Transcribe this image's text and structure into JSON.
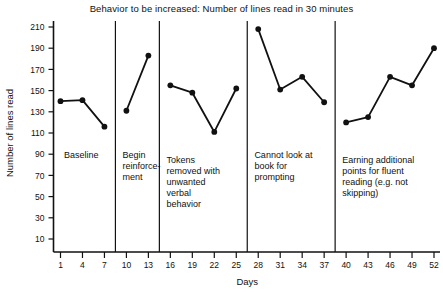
{
  "chart_data": {
    "type": "line",
    "title": "Behavior to be increased: Number of lines read in 30 minutes",
    "xlabel": "Days",
    "ylabel": "Number of lines read",
    "xlim": [
      0,
      53
    ],
    "ylim": [
      0,
      215
    ],
    "grid": false,
    "legend": "none",
    "x_ticks": [
      1,
      4,
      7,
      10,
      13,
      16,
      19,
      22,
      25,
      28,
      31,
      34,
      37,
      40,
      43,
      46,
      49,
      52
    ],
    "y_ticks": [
      10,
      30,
      50,
      70,
      90,
      110,
      130,
      150,
      170,
      190,
      210
    ],
    "marker": "filled-circle",
    "line_color": "#111111",
    "phases": [
      {
        "label": "Baseline",
        "x_start": 1,
        "x_end": 7,
        "x": [
          1,
          4,
          7
        ],
        "values": [
          140,
          141,
          116
        ]
      },
      {
        "label": "Begin reinforce-ment",
        "x_start": 10,
        "x_end": 13,
        "x": [
          10,
          13
        ],
        "values": [
          131,
          183
        ]
      },
      {
        "label": "Tokens removed with unwanted verbal behavior",
        "x_start": 16,
        "x_end": 25,
        "x": [
          16,
          19,
          22,
          25
        ],
        "values": [
          155,
          148,
          111,
          152
        ]
      },
      {
        "label": "Cannot look at book for prompting",
        "x_start": 28,
        "x_end": 37,
        "x": [
          28,
          31,
          34,
          37
        ],
        "values": [
          208,
          151,
          163,
          139
        ]
      },
      {
        "label": "Earning additional points for fluent reading (e.g. not skipping)",
        "x_start": 40,
        "x_end": 52,
        "x": [
          40,
          43,
          46,
          49,
          52
        ],
        "values": [
          120,
          125,
          163,
          155,
          190
        ]
      }
    ],
    "phase_divider_x": [
      8.5,
      14.5,
      26.5,
      38.5
    ],
    "phase_label_lines": [
      [
        "Baseline"
      ],
      [
        "Begin",
        "reinforce-",
        "ment"
      ],
      [
        "Tokens",
        "removed with",
        "unwanted",
        "verbal",
        "behavior"
      ],
      [
        "Cannot look at",
        "book for",
        "prompting"
      ],
      [
        "Earning additional",
        "points for fluent",
        "reading (e.g. not",
        "skipping)"
      ]
    ],
    "phase_label_x": [
      1.2,
      9.2,
      15.2,
      27.2,
      39.2
    ],
    "phase_label_top_y": [
      92,
      92,
      97,
      92,
      97
    ]
  }
}
